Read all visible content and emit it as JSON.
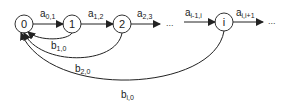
{
  "diagram": {
    "type": "state-transition-chain",
    "nodes": [
      {
        "id": "0",
        "label": "0"
      },
      {
        "id": "1",
        "label": "1"
      },
      {
        "id": "2",
        "label": "2"
      },
      {
        "id": "i",
        "label": "i"
      }
    ],
    "forward_edges": [
      {
        "from": "0",
        "to": "1",
        "base": "a",
        "sub": "0,1"
      },
      {
        "from": "1",
        "to": "2",
        "base": "a",
        "sub": "1,2"
      },
      {
        "from": "2",
        "to": "...",
        "base": "a",
        "sub": "2,3"
      },
      {
        "from": "...",
        "to": "i",
        "base": "a",
        "sub": "i-1,i"
      },
      {
        "from": "i",
        "to": "...",
        "base": "a",
        "sub": "i,i+1"
      }
    ],
    "back_edges": [
      {
        "from": "1",
        "to": "0",
        "base": "b",
        "sub": "1,0"
      },
      {
        "from": "2",
        "to": "0",
        "base": "b",
        "sub": "2,0"
      },
      {
        "from": "i",
        "to": "0",
        "base": "b",
        "sub": "i,0"
      }
    ],
    "ellipsis": "...",
    "colors": {
      "stroke": "#222222",
      "background": "#ffffff"
    }
  }
}
